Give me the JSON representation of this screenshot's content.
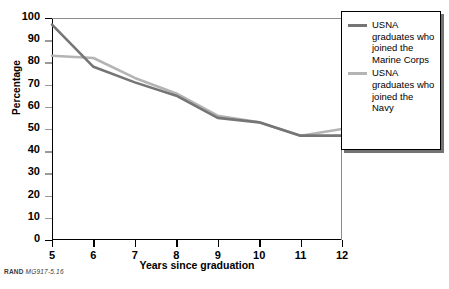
{
  "chart_data": {
    "type": "line",
    "title": "",
    "xlabel": "Years since graduation",
    "ylabel": "Percentage",
    "x": [
      5,
      6,
      7,
      8,
      9,
      10,
      11,
      12
    ],
    "xlim": [
      5,
      12
    ],
    "ylim": [
      0,
      100
    ],
    "xticks": [
      "5",
      "6",
      "7",
      "8",
      "9",
      "10",
      "11",
      "12"
    ],
    "yticks": [
      "0",
      "10",
      "20",
      "30",
      "40",
      "50",
      "60",
      "70",
      "80",
      "90",
      "100"
    ],
    "grid": false,
    "legend_position": "right",
    "series": [
      {
        "name": "USNA graduates who joined the Marine Corps",
        "color": "#757575",
        "values": [
          97,
          78,
          71,
          65,
          55,
          53,
          47,
          47
        ]
      },
      {
        "name": "USNA graduates who joined the Navy",
        "color": "#b4b4b4",
        "values": [
          83,
          82,
          73,
          66,
          56,
          53,
          47,
          50
        ]
      }
    ]
  },
  "axes": {
    "ylabel": "Percentage",
    "xlabel": "Years since graduation"
  },
  "legend": {
    "entries": [
      {
        "label": "USNA graduates who joined the Marine Corps",
        "color": "#757575"
      },
      {
        "label": "USNA graduates who joined the Navy",
        "color": "#b4b4b4"
      }
    ]
  },
  "footer": {
    "prefix": "RAND",
    "code": "MG917-5.16"
  }
}
